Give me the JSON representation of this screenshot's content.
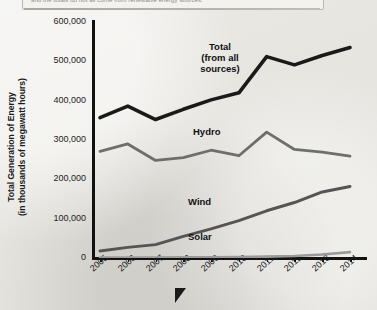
{
  "banner": {
    "text": "and the totals do not all come from renewable energy sources.",
    "swatch_color": "#6d6d6d"
  },
  "chart_data": {
    "type": "line",
    "title": "",
    "xlabel": "",
    "ylabel": "Total Generation of Energy (in thousands of megawatt hours)",
    "ylabel_line1": "Total Generation of Energy",
    "ylabel_line2": "(in thousands of megawatt hours)",
    "categories": [
      "2005",
      "2006",
      "2007",
      "2008",
      "2009",
      "2010",
      "2011",
      "2012",
      "2013",
      "2014"
    ],
    "ylim": [
      0,
      600000
    ],
    "ytick_labels": [
      "600,000",
      "500,000",
      "400,000",
      "300,000",
      "200,000",
      "100,000",
      "0"
    ],
    "ytick_values": [
      600000,
      500000,
      400000,
      300000,
      200000,
      100000,
      0
    ],
    "grid": false,
    "legend_position": "inline-labels",
    "series": [
      {
        "name": "Total (from all sources)",
        "label_line1": "Total",
        "label_line2": "(from all",
        "label_line3": "sources)",
        "color": "#1a1a1a",
        "width": 3.6,
        "values": [
          357000,
          386000,
          352000,
          378000,
          402000,
          420000,
          512000,
          491000,
          515000,
          535000
        ]
      },
      {
        "name": "Hydro",
        "label_line1": "Hydro",
        "color": "#6e6e6e",
        "width": 2.8,
        "values": [
          271000,
          290000,
          248000,
          255000,
          274000,
          260000,
          320000,
          276000,
          269000,
          259000
        ]
      },
      {
        "name": "Wind",
        "label_line1": "Wind",
        "color": "#555555",
        "width": 3.0,
        "values": [
          18000,
          27000,
          34000,
          55000,
          74000,
          95000,
          120000,
          141000,
          168000,
          182000
        ]
      },
      {
        "name": "Solar",
        "label_line1": "Solar",
        "color": "#9a9a9a",
        "width": 2.6,
        "values": [
          1000,
          1000,
          1000,
          1500,
          2000,
          2500,
          3500,
          5000,
          9000,
          15000
        ]
      }
    ]
  }
}
